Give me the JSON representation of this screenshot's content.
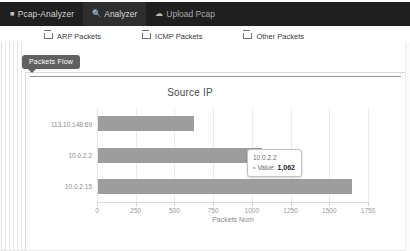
{
  "navbar": {
    "brand": "Pcap-Analyzer",
    "brand_icon": "grid-icon",
    "items": [
      {
        "label": "Analyzer",
        "icon": "search-icon",
        "active": true
      },
      {
        "label": "Upload Pcap",
        "icon": "cloud-upload-icon",
        "active": false
      }
    ]
  },
  "filters": [
    {
      "label": "ARP Packets",
      "checked": false
    },
    {
      "label": "ICMP Packets",
      "checked": false
    },
    {
      "label": "Other Packets",
      "checked": false
    }
  ],
  "badge": {
    "label": "Packets Flow"
  },
  "tooltip": {
    "title": "10.0.2.2",
    "marker": "•",
    "key": "Value:",
    "value": "1,062"
  },
  "chart_data": {
    "type": "bar",
    "orientation": "horizontal",
    "title": "Source IP",
    "xlabel": "Packets Num",
    "ylabel": "",
    "categories": [
      "113.10.148.69",
      "10.0.2.2",
      "10.0.2.15"
    ],
    "values": [
      620,
      1062,
      1640
    ],
    "xlim": [
      0,
      1750
    ],
    "xticks": [
      0,
      250,
      500,
      750,
      1000,
      1250,
      1500,
      1750
    ],
    "xtick_labels": [
      "0",
      "250",
      "500",
      "750",
      "1000",
      "1250",
      "1500",
      "1750"
    ],
    "grid": true,
    "legend": false,
    "bar_color": "#9d9d9d"
  }
}
